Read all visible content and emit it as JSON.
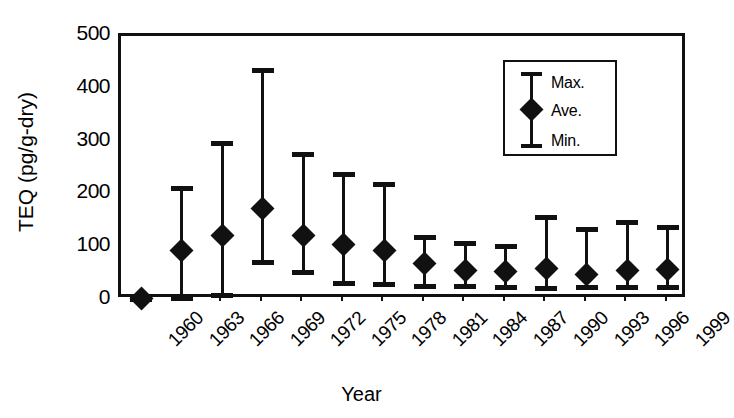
{
  "chart_data": {
    "type": "scatter",
    "title": "",
    "xlabel": "Year",
    "ylabel": "TEQ (pg/g-dry)",
    "ylim": [
      0,
      500
    ],
    "yticks": [
      0,
      100,
      200,
      300,
      400,
      500
    ],
    "grid": false,
    "legend_position": "top-right",
    "categories": [
      "1960",
      "1963",
      "1966",
      "1969",
      "1972",
      "1975",
      "1978",
      "1981",
      "1984",
      "1987",
      "1990",
      "1993",
      "1996",
      "1999"
    ],
    "series": [
      {
        "name": "Max.",
        "values": [
          5,
          212,
          298,
          435,
          277,
          238,
          219,
          120,
          108,
          103,
          157,
          135,
          148,
          138
        ]
      },
      {
        "name": "Ave.",
        "values": [
          3,
          93,
          122,
          173,
          122,
          105,
          93,
          70,
          55,
          54,
          60,
          48,
          55,
          58
        ]
      },
      {
        "name": "Min.",
        "values": [
          0,
          2,
          7,
          70,
          51,
          30,
          28,
          24,
          24,
          22,
          20,
          23,
          23,
          22
        ]
      }
    ],
    "points": [
      {
        "year": "1960",
        "max": 5,
        "ave": 3,
        "min": 0
      },
      {
        "year": "1963",
        "max": 212,
        "ave": 93,
        "min": 2
      },
      {
        "year": "1966",
        "max": 298,
        "ave": 122,
        "min": 7
      },
      {
        "year": "1969",
        "max": 435,
        "ave": 173,
        "min": 70
      },
      {
        "year": "1972",
        "max": 277,
        "ave": 122,
        "min": 51
      },
      {
        "year": "1975",
        "max": 238,
        "ave": 105,
        "min": 30
      },
      {
        "year": "1978",
        "max": 219,
        "ave": 93,
        "min": 28
      },
      {
        "year": "1981",
        "max": 120,
        "ave": 70,
        "min": 24
      },
      {
        "year": "1984",
        "max": 108,
        "ave": 55,
        "min": 24
      },
      {
        "year": "1987",
        "max": 103,
        "ave": 54,
        "min": 22
      },
      {
        "year": "1990",
        "max": 157,
        "ave": 60,
        "min": 20
      },
      {
        "year": "1993",
        "max": 135,
        "ave": 48,
        "min": 23
      },
      {
        "year": "1996",
        "max": 148,
        "ave": 55,
        "min": 23
      },
      {
        "year": "1999",
        "max": 138,
        "ave": 58,
        "min": 22
      }
    ]
  },
  "axes": {
    "y_title": "TEQ (pg/g-dry)",
    "x_title": "Year",
    "y_tick_labels": [
      "500",
      "400",
      "300",
      "200",
      "100",
      "0"
    ],
    "x_tick_labels": [
      "1960",
      "1963",
      "1966",
      "1969",
      "1972",
      "1975",
      "1978",
      "1981",
      "1984",
      "1987",
      "1990",
      "1993",
      "1996",
      "1999"
    ]
  },
  "legend": {
    "max_label": "Max.",
    "ave_label": "Ave.",
    "min_label": "Min."
  },
  "colors": {
    "ink": "#111111",
    "background": "#ffffff"
  }
}
